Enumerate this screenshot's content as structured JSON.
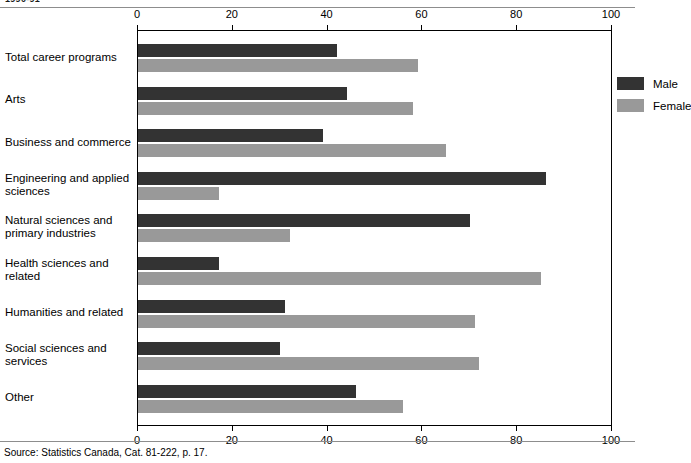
{
  "figure": {
    "clipped_title": "1990-91",
    "source": "Source: Statistics Canada, Cat. 81-222, p. 17."
  },
  "legend": {
    "male_label": "Male",
    "female_label": "Female",
    "male_color": "#333333",
    "female_color": "#999999"
  },
  "chart_data": {
    "type": "bar",
    "orientation": "horizontal",
    "title": "",
    "xlabel": "",
    "ylabel": "",
    "xlim": [
      0,
      100
    ],
    "xticks": [
      0,
      20,
      40,
      60,
      80,
      100
    ],
    "xticklabels": [
      "0",
      "20",
      "40",
      "60",
      "80",
      "100"
    ],
    "grid": false,
    "axis_positions": [
      "top",
      "bottom"
    ],
    "legend_position": "top-right inside plot",
    "categories": [
      "Total career programs",
      "Arts",
      "Business and commerce",
      "Engineering and applied sciences",
      "Natural sciences and primary industries",
      "Health sciences and related",
      "Humanities and related",
      "Social sciences and services",
      "Other"
    ],
    "category_lines": [
      [
        "Total career programs"
      ],
      [
        "Arts"
      ],
      [
        "Business and commerce"
      ],
      [
        "Engineering and applied",
        "sciences"
      ],
      [
        "Natural sciences and",
        "primary industries"
      ],
      [
        "Health sciences and",
        "related"
      ],
      [
        "Humanities and related"
      ],
      [
        "Social sciences and",
        "services"
      ],
      [
        "Other"
      ]
    ],
    "series": [
      {
        "name": "Male",
        "color": "#333333",
        "values": [
          42,
          44,
          39,
          86,
          70,
          17,
          31,
          30,
          46
        ]
      },
      {
        "name": "Female",
        "color": "#999999",
        "values": [
          59,
          58,
          65,
          17,
          32,
          85,
          71,
          72,
          56
        ]
      }
    ]
  }
}
